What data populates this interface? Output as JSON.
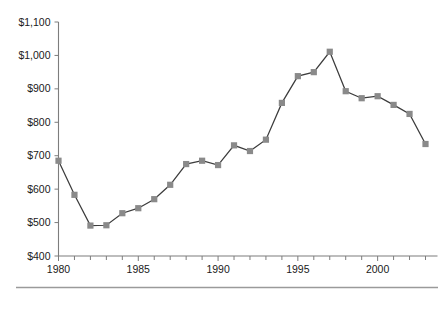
{
  "chart_data": {
    "type": "line",
    "title": "",
    "subtitle": "",
    "xlabel": "",
    "ylabel": "",
    "x": [
      1980,
      1981,
      1982,
      1983,
      1984,
      1985,
      1986,
      1987,
      1988,
      1989,
      1990,
      1991,
      1992,
      1993,
      1994,
      1995,
      1996,
      1997,
      1998,
      1999,
      2000,
      2001,
      2002,
      2003
    ],
    "values": [
      685,
      583,
      491,
      492,
      528,
      543,
      570,
      613,
      675,
      685,
      672,
      731,
      714,
      748,
      858,
      938,
      950,
      1011,
      893,
      872,
      878,
      852,
      825,
      735
    ],
    "series": [
      {
        "name": "",
        "values": [
          685,
          583,
          491,
          492,
          528,
          543,
          570,
          613,
          675,
          685,
          672,
          731,
          714,
          748,
          858,
          938,
          950,
          1011,
          893,
          872,
          878,
          852,
          825,
          735
        ]
      }
    ],
    "xlim": [
      1979.5,
      2003.5
    ],
    "ylim": [
      400,
      1100
    ],
    "ytick_values": [
      400,
      500,
      600,
      700,
      800,
      900,
      1000,
      1100
    ],
    "ytick_labels": [
      "$400",
      "$500",
      "$600",
      "$700",
      "$800",
      "$900",
      "$1,000",
      "$1,100"
    ],
    "xtick_values": [
      1980,
      1981,
      1982,
      1983,
      1984,
      1985,
      1986,
      1987,
      1988,
      1989,
      1990,
      1991,
      1992,
      1993,
      1994,
      1995,
      1996,
      1997,
      1998,
      1999,
      2000,
      2001,
      2002,
      2003
    ],
    "xtick_labeled": [
      1980,
      1985,
      1990,
      1995,
      2000
    ],
    "xtick_labels": [
      "1980",
      "1985",
      "1990",
      "1995",
      "2000"
    ],
    "grid": false,
    "legend": false,
    "legend_position": "none",
    "marker": "square",
    "colors": {
      "line": "#3c3c3c",
      "marker": "#8a8a8a",
      "axis": "#7d7d7d",
      "text": "#1a1a1a",
      "rule": "#9a9a9a",
      "background": "#ffffff"
    }
  },
  "footer": {
    "rule_present": true
  }
}
